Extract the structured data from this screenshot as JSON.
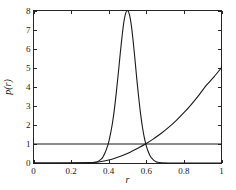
{
  "chart_data": {
    "type": "line",
    "title": "",
    "subtitle": "",
    "xlabel": "r",
    "ylabel": "p(r)",
    "xlim": [
      0,
      1
    ],
    "ylim": [
      0,
      8
    ],
    "grid": false,
    "legend": "none",
    "background_color": "#ffffff",
    "axis_color": "#262626",
    "curve_color": "#1a1a1a",
    "xticks": [
      0,
      0.2,
      0.4,
      0.6,
      0.8,
      1
    ],
    "xtick_labels": [
      "0",
      "0.2",
      "0.4",
      "0.6",
      "0.8",
      "1"
    ],
    "yticks": [
      0,
      1,
      2,
      3,
      4,
      5,
      6,
      7,
      8
    ],
    "ytick_labels": [
      "0",
      "1",
      "2",
      "3",
      "4",
      "5",
      "6",
      "7",
      "8"
    ],
    "series": [
      {
        "name": "narrow-peak",
        "description": "Sharp unimodal peak centered at r = 0.5 reaching p(r) = 8",
        "peak_x": 0.5,
        "peak_y": 8,
        "x": [
          0.0,
          0.2,
          0.28,
          0.32,
          0.34,
          0.36,
          0.37,
          0.38,
          0.39,
          0.4,
          0.41,
          0.42,
          0.43,
          0.44,
          0.45,
          0.46,
          0.47,
          0.48,
          0.49,
          0.5,
          0.51,
          0.52,
          0.53,
          0.54,
          0.55,
          0.56,
          0.57,
          0.58,
          0.59,
          0.6,
          0.61,
          0.62,
          0.63,
          0.64,
          0.65,
          0.66,
          0.68,
          0.72,
          0.8,
          1.0
        ],
        "y": [
          0.0,
          0.0,
          0.01,
          0.03,
          0.07,
          0.2,
          0.33,
          0.52,
          0.78,
          1.1,
          1.55,
          2.1,
          2.8,
          3.65,
          4.6,
          5.6,
          6.55,
          7.35,
          7.85,
          8.0,
          7.8,
          7.25,
          6.4,
          5.4,
          4.35,
          3.4,
          2.55,
          1.85,
          1.3,
          0.9,
          0.6,
          0.38,
          0.24,
          0.14,
          0.08,
          0.04,
          0.01,
          0.0,
          0.0,
          0.0
        ]
      },
      {
        "name": "rising-curve",
        "description": "Monotonically increasing convex curve from ~0 near r = 0.33 to p(r) = 5 at r = 1",
        "endpoint_x": 1,
        "endpoint_y": 5,
        "x": [
          0.0,
          0.15,
          0.25,
          0.3,
          0.33,
          0.36,
          0.4,
          0.44,
          0.48,
          0.52,
          0.56,
          0.6,
          0.64,
          0.68,
          0.72,
          0.76,
          0.8,
          0.84,
          0.88,
          0.92,
          0.96,
          1.0
        ],
        "y": [
          0.0,
          0.0,
          0.01,
          0.02,
          0.04,
          0.08,
          0.16,
          0.28,
          0.42,
          0.6,
          0.8,
          1.02,
          1.28,
          1.56,
          1.88,
          2.24,
          2.64,
          3.08,
          3.56,
          4.08,
          4.52,
          5.0
        ]
      },
      {
        "name": "constant-line",
        "description": "Horizontal reference line at p(r) = 1 spanning the full x range",
        "constant_value": 1,
        "x": [
          0.0,
          1.0
        ],
        "y": [
          1.0,
          1.0
        ]
      }
    ]
  }
}
